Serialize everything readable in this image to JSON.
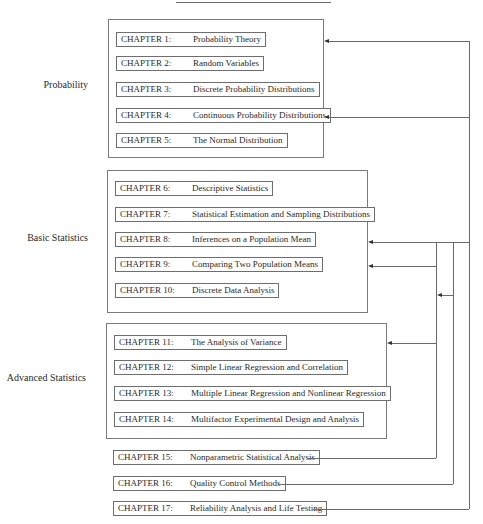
{
  "groups": [
    {
      "label": "Probability"
    },
    {
      "label": "Basic Statistics"
    },
    {
      "label": "Advanced Statistics"
    }
  ],
  "chapters": [
    {
      "num": "CHAPTER 1:",
      "title": "Probability Theory"
    },
    {
      "num": "CHAPTER 2:",
      "title": "Random Variables"
    },
    {
      "num": "CHAPTER 3:",
      "title": "Discrete Probability Distributions"
    },
    {
      "num": "CHAPTER 4:",
      "title": "Continuous Probability Distributions"
    },
    {
      "num": "CHAPTER 5:",
      "title": "The Normal Distribution"
    },
    {
      "num": "CHAPTER 6:",
      "title": "Descriptive Statistics"
    },
    {
      "num": "CHAPTER 7:",
      "title": "Statistical Estimation and Sampling Distributions"
    },
    {
      "num": "CHAPTER 8:",
      "title": "Inferences on a Population Mean"
    },
    {
      "num": "CHAPTER 9:",
      "title": "Comparing Two Population Means"
    },
    {
      "num": "CHAPTER 10:",
      "title": "Discrete Data Analysis"
    },
    {
      "num": "CHAPTER 11:",
      "title": "The Analysis of Variance"
    },
    {
      "num": "CHAPTER 12:",
      "title": "Simple Linear Regression and Correlation"
    },
    {
      "num": "CHAPTER 13:",
      "title": "Multiple Linear Regression and Nonlinear Regression"
    },
    {
      "num": "CHAPTER 14:",
      "title": "Multifactor Experimental Design and Analysis"
    },
    {
      "num": "CHAPTER 15:",
      "title": "Nonparametric Statistical Analysis"
    },
    {
      "num": "CHAPTER 16:",
      "title": "Quality Control Methods"
    },
    {
      "num": "CHAPTER 17:",
      "title": "Reliability Analysis and Life Testing"
    }
  ],
  "colors": {
    "line": "#6a6a6a",
    "text": "#2a2a2a",
    "background": "#ffffff"
  }
}
